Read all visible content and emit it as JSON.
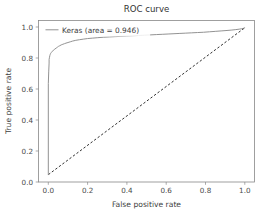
{
  "chart_data": {
    "type": "line",
    "title": "ROC curve",
    "xlabel": "False positive rate",
    "ylabel": "True positive rate",
    "xlim": [
      -0.05,
      1.05
    ],
    "ylim": [
      -0.05,
      1.05
    ],
    "grid": false,
    "legend_position": "upper left",
    "xticks": [
      "0.0",
      "0.2",
      "0.4",
      "0.6",
      "0.8",
      "1.0"
    ],
    "xtick_values": [
      0.0,
      0.2,
      0.4,
      0.6,
      0.8,
      1.0
    ],
    "yticks": [
      "0.0",
      "0.2",
      "0.4",
      "0.6",
      "0.8",
      "1.0"
    ],
    "ytick_values": [
      0.0,
      0.2,
      0.4,
      0.6,
      0.8,
      1.0
    ],
    "series": [
      {
        "name": "Keras (area = 0.946)",
        "color": "#8c8c8c",
        "style": "solid",
        "auc": 0.946,
        "x": [
          0.0,
          0.0,
          0.002,
          0.004,
          0.004,
          0.006,
          0.008,
          0.01,
          0.012,
          0.014,
          0.016,
          0.018,
          0.022,
          0.026,
          0.03,
          0.034,
          0.04,
          0.046,
          0.052,
          0.058,
          0.066,
          0.074,
          0.082,
          0.09,
          0.1,
          0.112,
          0.124,
          0.14,
          0.158,
          0.178,
          0.2,
          0.226,
          0.252,
          0.28,
          0.31,
          0.34,
          0.37,
          0.4,
          0.43,
          0.46,
          0.49,
          0.52,
          0.55,
          0.58,
          0.61,
          0.64,
          0.67,
          0.7,
          0.73,
          0.76,
          0.79,
          0.82,
          0.85,
          0.88,
          0.91,
          0.935,
          0.955,
          0.972,
          0.985,
          0.994,
          1.0
        ],
        "y": [
          0.0,
          0.62,
          0.7,
          0.76,
          0.784,
          0.8,
          0.812,
          0.82,
          0.826,
          0.83,
          0.833,
          0.836,
          0.842,
          0.848,
          0.852,
          0.856,
          0.862,
          0.868,
          0.874,
          0.878,
          0.884,
          0.888,
          0.892,
          0.896,
          0.9,
          0.905,
          0.91,
          0.915,
          0.919,
          0.923,
          0.927,
          0.93,
          0.933,
          0.936,
          0.938,
          0.94,
          0.942,
          0.944,
          0.946,
          0.948,
          0.95,
          0.952,
          0.954,
          0.956,
          0.958,
          0.96,
          0.962,
          0.964,
          0.966,
          0.968,
          0.97,
          0.973,
          0.976,
          0.979,
          0.982,
          0.985,
          0.988,
          0.991,
          0.994,
          0.997,
          1.0
        ]
      },
      {
        "name": "chance-diagonal",
        "color": "#1a1a1a",
        "style": "dashed",
        "x": [
          0.0,
          1.0
        ],
        "y": [
          0.0,
          1.0
        ]
      }
    ],
    "legend_entries": [
      {
        "label": "Keras (area = 0.946)",
        "color": "#8c8c8c"
      }
    ]
  }
}
